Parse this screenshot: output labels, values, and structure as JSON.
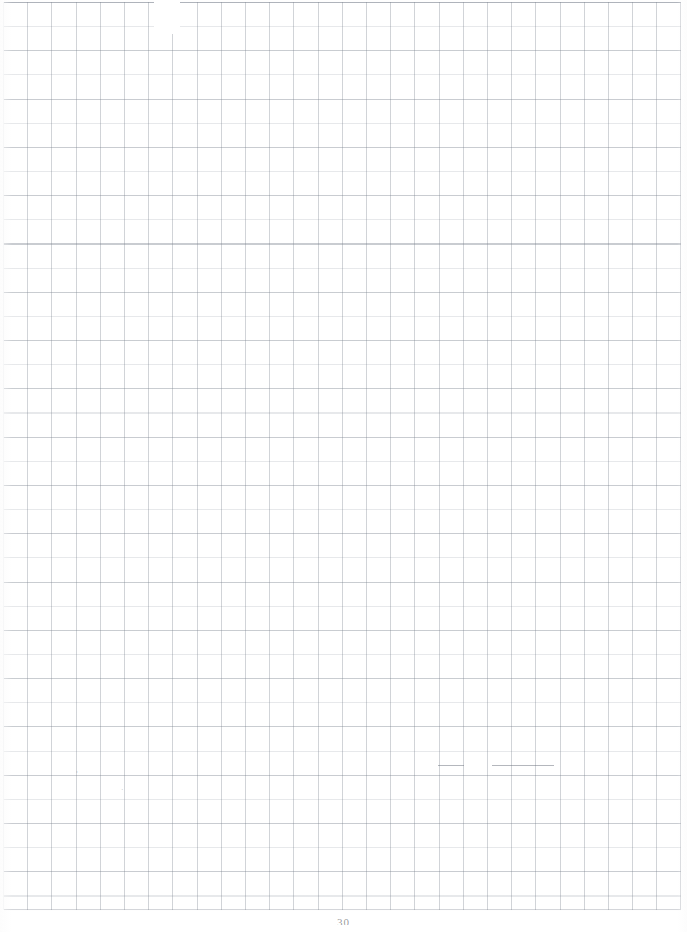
{
  "document": {
    "type": "scanned-grid-paper",
    "page_label": "30",
    "background_color": "#ffffff",
    "grid": {
      "line_color": "#78808c",
      "cell_size_px": 24,
      "columns": 28,
      "rows": 38,
      "left_px": 3,
      "top_px": 2,
      "width_px": 678,
      "height_px": 908,
      "border": true
    },
    "content": {
      "text_blocks": [],
      "note": ""
    },
    "artifacts": {
      "stray_marks": [
        "'",
        "."
      ],
      "faded_region_top_px": 154,
      "ink_run_row_px": 765
    }
  }
}
